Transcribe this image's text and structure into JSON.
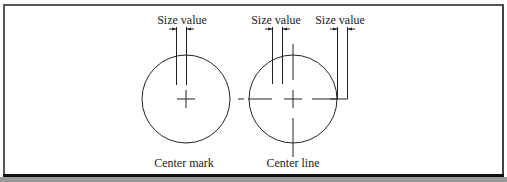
{
  "labels": {
    "size_value_1": "Size value",
    "size_value_2": "Size value",
    "size_value_3": "Size value",
    "center_mark": "Center mark",
    "center_line": "Center line"
  },
  "colors": {
    "line": "#222222",
    "frame": "#555555",
    "band": "#9a9a9a"
  }
}
